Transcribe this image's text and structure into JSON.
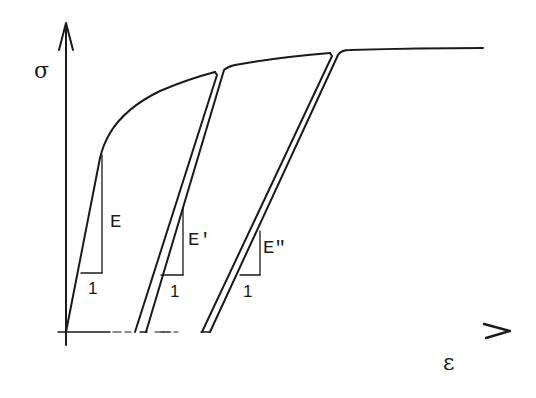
{
  "diagram": {
    "type": "stress-strain loading/unloading curve",
    "axes": {
      "y_label": "σ",
      "x_label": "ε"
    },
    "slope_triangles": [
      {
        "modulus_label": "E",
        "run_label": "1"
      },
      {
        "modulus_label": "E'",
        "run_label": "1"
      },
      {
        "modulus_label": "E\"",
        "run_label": "1"
      }
    ],
    "colors": {
      "line": "#1a1a1a",
      "background": "#ffffff"
    }
  }
}
